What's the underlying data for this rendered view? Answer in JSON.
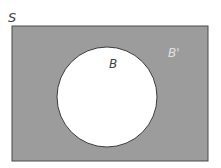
{
  "diagram": {
    "type": "venn",
    "universe_label": "S",
    "set_label": "B",
    "complement_label": "B'",
    "shaded_region": "complement of B",
    "colors": {
      "background": "#ffffff",
      "universe_fill": "#9c9c9c",
      "universe_stroke": "#4a4a4a",
      "set_fill": "#ffffff",
      "set_stroke": "#3a3a3a",
      "label_dark": "#444444",
      "label_light": "#e0e0e0"
    }
  }
}
